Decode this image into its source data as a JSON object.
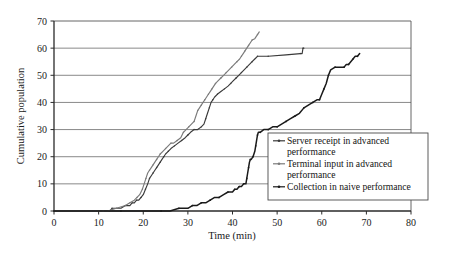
{
  "chart_data": {
    "type": "line",
    "title": "",
    "xlabel": "Time (min)",
    "ylabel": "Cumulative population",
    "xlim": [
      0,
      80
    ],
    "ylim": [
      0,
      70
    ],
    "xticks": [
      0,
      10,
      20,
      30,
      40,
      50,
      60,
      70,
      80
    ],
    "yticks": [
      0,
      10,
      20,
      30,
      40,
      50,
      60,
      70
    ],
    "grid": "horizontal",
    "legend_position": "lower-right-inside",
    "series": [
      {
        "name": "Server receipt in advanced performance",
        "color": "#3a3a3a",
        "points": [
          [
            0,
            0
          ],
          [
            6,
            0
          ],
          [
            10,
            0
          ],
          [
            12.5,
            0
          ],
          [
            13,
            1
          ],
          [
            15,
            1
          ],
          [
            16,
            2
          ],
          [
            17,
            2
          ],
          [
            17.5,
            3
          ],
          [
            18,
            3
          ],
          [
            18.5,
            4
          ],
          [
            19,
            4
          ],
          [
            19.5,
            5
          ],
          [
            20,
            6
          ],
          [
            20.5,
            8
          ],
          [
            21,
            10
          ],
          [
            21.4,
            12
          ],
          [
            21.8,
            13
          ],
          [
            22.2,
            14
          ],
          [
            22.6,
            15
          ],
          [
            23,
            16
          ],
          [
            23.4,
            17
          ],
          [
            23.8,
            18
          ],
          [
            24.2,
            19
          ],
          [
            24.6,
            20
          ],
          [
            25,
            21
          ],
          [
            25.6,
            22
          ],
          [
            26.2,
            23
          ],
          [
            27,
            24
          ],
          [
            27.8,
            25
          ],
          [
            28.6,
            26
          ],
          [
            29.4,
            27
          ],
          [
            30,
            28
          ],
          [
            30.6,
            29
          ],
          [
            31.4,
            30
          ],
          [
            32.2,
            30
          ],
          [
            33,
            31
          ],
          [
            33.6,
            32
          ],
          [
            34,
            34
          ],
          [
            34.4,
            36
          ],
          [
            34.8,
            38
          ],
          [
            35.2,
            40
          ],
          [
            35.6,
            41
          ],
          [
            36,
            42
          ],
          [
            36.6,
            43
          ],
          [
            37.4,
            44
          ],
          [
            38.2,
            45
          ],
          [
            39,
            46
          ],
          [
            39.6,
            47
          ],
          [
            40.2,
            48
          ],
          [
            40.8,
            49
          ],
          [
            41.4,
            50
          ],
          [
            42,
            51
          ],
          [
            42.6,
            52
          ],
          [
            43.2,
            53
          ],
          [
            43.8,
            54
          ],
          [
            44.4,
            55
          ],
          [
            45,
            56
          ],
          [
            45.6,
            57
          ],
          [
            46.2,
            57
          ],
          [
            48,
            57
          ],
          [
            52,
            57.5
          ],
          [
            55.2,
            58
          ],
          [
            55.6,
            58
          ],
          [
            55.8,
            60
          ],
          [
            56,
            60
          ]
        ]
      },
      {
        "name": "Terminal input in advanced performance",
        "color": "#7a7a7a",
        "points": [
          [
            0,
            0
          ],
          [
            8,
            0
          ],
          [
            11,
            0
          ],
          [
            12,
            0
          ],
          [
            14,
            1
          ],
          [
            16,
            2
          ],
          [
            17,
            3
          ],
          [
            18,
            4
          ],
          [
            18.6,
            5
          ],
          [
            19.2,
            6
          ],
          [
            19.8,
            8
          ],
          [
            20.2,
            10
          ],
          [
            20.6,
            12
          ],
          [
            21,
            14
          ],
          [
            21.4,
            15
          ],
          [
            21.8,
            16
          ],
          [
            22.2,
            17
          ],
          [
            22.6,
            18
          ],
          [
            23,
            19
          ],
          [
            23.4,
            20
          ],
          [
            23.8,
            21
          ],
          [
            24.4,
            22
          ],
          [
            25,
            23
          ],
          [
            25.6,
            24
          ],
          [
            26.2,
            25
          ],
          [
            26.8,
            25
          ],
          [
            27.6,
            26
          ],
          [
            28.4,
            27
          ],
          [
            29,
            29
          ],
          [
            29.6,
            30
          ],
          [
            30.2,
            31
          ],
          [
            30.8,
            32
          ],
          [
            31.4,
            33
          ],
          [
            31.8,
            35
          ],
          [
            32.2,
            37
          ],
          [
            32.6,
            38
          ],
          [
            33,
            39
          ],
          [
            33.4,
            40
          ],
          [
            33.8,
            41
          ],
          [
            34.2,
            42
          ],
          [
            34.6,
            43
          ],
          [
            35,
            44
          ],
          [
            35.4,
            45
          ],
          [
            35.8,
            46
          ],
          [
            36.2,
            47
          ],
          [
            36.8,
            48
          ],
          [
            37.4,
            49
          ],
          [
            38,
            50
          ],
          [
            38.6,
            51
          ],
          [
            39.2,
            52
          ],
          [
            39.8,
            53
          ],
          [
            40.4,
            54
          ],
          [
            41,
            55
          ],
          [
            41.6,
            56
          ],
          [
            42,
            57
          ],
          [
            42.4,
            58
          ],
          [
            42.8,
            59
          ],
          [
            43.2,
            60
          ],
          [
            43.6,
            61
          ],
          [
            44,
            62
          ],
          [
            44.4,
            63
          ],
          [
            45,
            63.5
          ],
          [
            45.6,
            65
          ],
          [
            46,
            66
          ]
        ]
      },
      {
        "name": "Collection in naive performance",
        "color": "#1a1a1a",
        "points": [
          [
            0,
            0
          ],
          [
            10,
            0
          ],
          [
            15,
            0
          ],
          [
            20,
            0
          ],
          [
            24,
            0
          ],
          [
            26,
            0
          ],
          [
            28,
            1
          ],
          [
            30,
            1
          ],
          [
            31,
            2
          ],
          [
            32,
            2
          ],
          [
            33,
            3
          ],
          [
            34,
            3
          ],
          [
            35,
            4
          ],
          [
            36,
            5
          ],
          [
            37,
            5
          ],
          [
            38,
            6
          ],
          [
            39,
            7
          ],
          [
            40,
            7
          ],
          [
            40.5,
            8
          ],
          [
            41,
            8
          ],
          [
            41.5,
            9
          ],
          [
            42,
            9
          ],
          [
            42.5,
            10
          ],
          [
            43,
            10
          ],
          [
            43.2,
            12
          ],
          [
            43.4,
            14
          ],
          [
            43.6,
            16
          ],
          [
            43.8,
            18
          ],
          [
            44,
            19
          ],
          [
            44.2,
            19
          ],
          [
            44.6,
            20
          ],
          [
            45,
            22
          ],
          [
            45.2,
            24
          ],
          [
            45.4,
            26
          ],
          [
            45.6,
            28
          ],
          [
            45.8,
            29
          ],
          [
            46.2,
            29
          ],
          [
            47,
            30
          ],
          [
            48,
            30
          ],
          [
            49,
            31
          ],
          [
            50,
            31
          ],
          [
            51,
            32
          ],
          [
            52,
            33
          ],
          [
            53,
            34
          ],
          [
            54,
            35
          ],
          [
            55,
            36
          ],
          [
            56,
            38
          ],
          [
            57,
            39
          ],
          [
            58,
            40
          ],
          [
            59,
            41
          ],
          [
            59.5,
            41
          ],
          [
            60,
            43
          ],
          [
            60.5,
            45
          ],
          [
            61,
            47
          ],
          [
            61.5,
            50
          ],
          [
            62,
            52
          ],
          [
            63,
            53
          ],
          [
            64,
            53
          ],
          [
            65,
            53
          ],
          [
            65.5,
            54
          ],
          [
            66,
            54
          ],
          [
            66.5,
            55
          ],
          [
            67,
            56
          ],
          [
            67.5,
            57
          ],
          [
            68,
            57
          ],
          [
            68.5,
            58
          ]
        ]
      }
    ]
  },
  "legend": {
    "entries": [
      {
        "label_line1": "Server receipt in advanced",
        "label_line2": "performance",
        "marker": "line-with-arrow-marker"
      },
      {
        "label_line1": "Terminal input in advanced",
        "label_line2": "performance",
        "marker": "line-with-arrow-marker"
      },
      {
        "label_line1": "Collection in naive performance",
        "label_line2": "",
        "marker": "line-with-arrow-marker"
      }
    ]
  }
}
